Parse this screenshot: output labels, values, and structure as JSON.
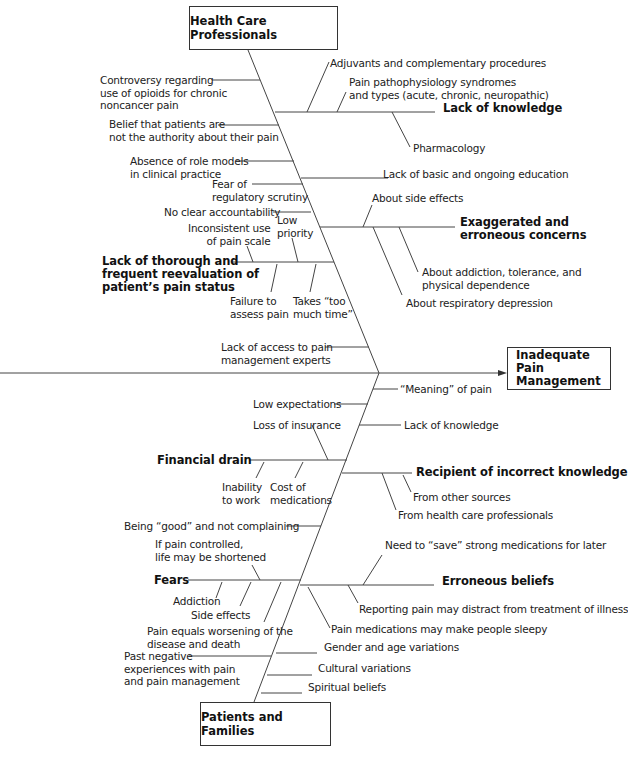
{
  "diagram": {
    "type": "fishbone",
    "effect": "Inadequate Pain Management",
    "effect_lines": [
      "Inadequate",
      "Pain",
      "Management"
    ],
    "top_category": "Health Care Professionals",
    "bottom_category": "Patients and Families",
    "top": {
      "direct_causes": {
        "controversy": [
          "Controversy regarding",
          "use of opioids for chronic",
          "noncancer pain"
        ],
        "belief_authority": [
          "Belief that patients are",
          "not the authority about their pain"
        ],
        "role_models": [
          "Absence of role models",
          "in clinical practice"
        ],
        "regulatory": [
          "Fear of",
          "regulatory scrutiny"
        ],
        "accountability": "No clear accountability",
        "education": "Lack of basic and ongoing education",
        "access_experts": [
          "Lack of access to pain",
          "management experts"
        ]
      },
      "lack_of_knowledge": {
        "label": "Lack of knowledge",
        "items": {
          "adjuvants": "Adjuvants and  complementary procedures",
          "pathophysiology": [
            "Pain pathophysiology syndromes",
            "and types (acute, chronic, neuropathic)"
          ],
          "pharmacology": "Pharmacology"
        }
      },
      "exaggerated_concerns": {
        "label": [
          "Exaggerated and",
          "erroneous concerns"
        ],
        "items": {
          "side_effects": "About side effects",
          "addiction": [
            "About addiction, tolerance, and",
            "physical dependence"
          ],
          "respiratory": "About respiratory depression"
        }
      },
      "reevaluation": {
        "label": [
          "Lack of thorough and",
          "frequent reevaluation of",
          "patient’s pain status"
        ],
        "items": {
          "inconsistent": [
            "Inconsistent use",
            "of pain scale"
          ],
          "low_priority": [
            "Low",
            "priority"
          ],
          "failure": [
            "Failure to",
            "assess pain"
          ],
          "too_much_time": [
            "Takes “too",
            "much time”"
          ]
        }
      }
    },
    "bottom": {
      "direct_causes": {
        "meaning": "“Meaning” of pain",
        "low_expectations": "Low expectations",
        "lack_knowledge": "Lack of knowledge",
        "being_good": "Being “good” and not complaining",
        "gender_age": "Gender and age variations",
        "past_negative": [
          "Past negative",
          "experiences with pain",
          "and pain management"
        ],
        "cultural": "Cultural variations",
        "spiritual": "Spiritual beliefs"
      },
      "financial_drain": {
        "label": "Financial drain",
        "items": {
          "insurance": "Loss of insurance",
          "inability": [
            "Inability",
            "to work"
          ],
          "cost": [
            "Cost of",
            "medications"
          ]
        }
      },
      "recipient": {
        "label": "Recipient of incorrect knowledge",
        "items": {
          "other_sources": "From other sources",
          "hcp": "From health care professionals"
        }
      },
      "fears": {
        "label": "Fears",
        "items": {
          "life_shortened": [
            "If pain controlled,",
            "life may be shortened"
          ],
          "addiction": "Addiction",
          "side_effects": "Side effects",
          "worsening": [
            "Pain equals worsening of the",
            "disease and death"
          ]
        }
      },
      "erroneous_beliefs": {
        "label": "Erroneous beliefs",
        "items": {
          "save": "Need to “save” strong medications for later",
          "distract": "Reporting pain may distract from treatment of illness",
          "sleepy": "Pain medications may make people sleepy"
        }
      }
    },
    "colors": {
      "line": "#444444",
      "text": "#222222",
      "background": "#ffffff"
    }
  }
}
